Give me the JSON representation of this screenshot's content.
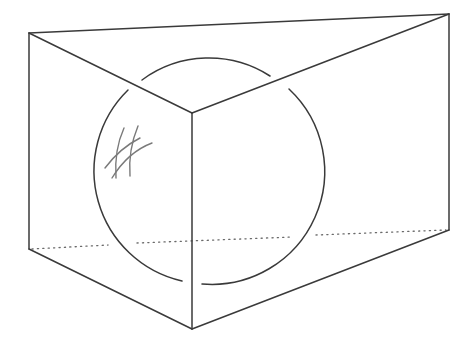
{
  "figure": {
    "colors": {
      "background": "#ffffff",
      "edge": "#3a3a3a",
      "hidden_edge": "#6a6a6a",
      "hatch": "#7a7a7a"
    },
    "prism": {
      "vertices": {
        "top_left": [
          29,
          33
        ],
        "top_right": [
          449,
          14
        ],
        "top_front": [
          192,
          113
        ],
        "bottom_left": [
          29,
          249
        ],
        "bottom_right": [
          449,
          230
        ],
        "bottom_front": [
          192,
          329
        ]
      },
      "hidden_edge": "bottom_left-bottom_right (dotted)"
    },
    "sphere": {
      "center": [
        206,
        171
      ],
      "radius": 113,
      "gaps_at_edges": true
    },
    "hatch_mark": {
      "strokes": 4,
      "location": "upper-left of sphere"
    }
  }
}
